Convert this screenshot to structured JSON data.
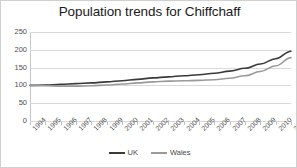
{
  "chart_data": {
    "type": "line",
    "title": "Population trends for Chiffchaff",
    "xlabel": "",
    "ylabel": "",
    "ylim": [
      0,
      250
    ],
    "yticks": [
      0,
      50,
      100,
      150,
      200,
      250
    ],
    "grid": true,
    "legend_position": "bottom",
    "categories": [
      "1994",
      "1995",
      "1996",
      "1997",
      "1998",
      "1999",
      "2000",
      "2001",
      "2002",
      "2003",
      "2004",
      "2005",
      "2006",
      "2007",
      "2008",
      "2009",
      "2010",
      "2011"
    ],
    "series": [
      {
        "name": "UK",
        "color": "#3a3a3a",
        "values": [
          100,
          101,
          103,
          105,
          107,
          110,
          113,
          117,
          121,
          124,
          127,
          130,
          134,
          140,
          148,
          160,
          175,
          196
        ]
      },
      {
        "name": "Wales",
        "color": "#9a9a9a",
        "values": [
          100,
          99,
          98,
          98,
          99,
          101,
          104,
          107,
          110,
          112,
          113,
          114,
          116,
          120,
          127,
          139,
          155,
          178
        ]
      }
    ]
  },
  "legend": {
    "items": [
      {
        "label": "UK",
        "color": "#3a3a3a"
      },
      {
        "label": "Wales",
        "color": "#9a9a9a"
      }
    ]
  },
  "colors": {
    "grid": "#d9d9d9",
    "axis": "#b5b5b5",
    "text": "#4f4f4f",
    "title": "#1a1a1a",
    "border": "#d0d0d0",
    "background": "#ffffff"
  }
}
